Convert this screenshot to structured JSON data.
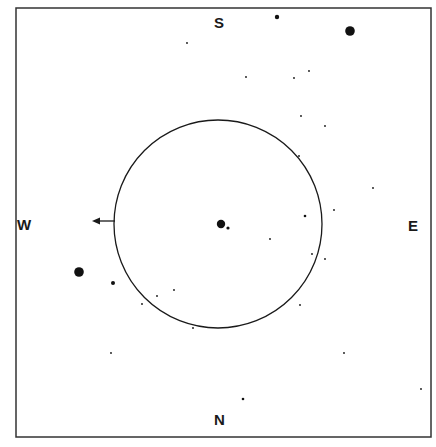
{
  "diagram": {
    "type": "star-finder-chart",
    "frame": {
      "x": 16,
      "y": 8,
      "width": 415,
      "height": 429,
      "stroke": "#333333"
    },
    "circle": {
      "cx": 218,
      "cy": 224,
      "r": 104,
      "stroke": "#1a1a1a"
    },
    "arrow": {
      "x1": 115,
      "y1": 221,
      "x2": 92,
      "y2": 221,
      "direction": "west"
    },
    "compass": {
      "north": {
        "label": "N",
        "x": 219,
        "y": 412
      },
      "south": {
        "label": "S",
        "x": 219,
        "y": 15
      },
      "east": {
        "label": "E",
        "x": 413,
        "y": 218
      },
      "west": {
        "label": "W",
        "x": 22,
        "y": 217
      }
    },
    "stars": [
      {
        "x": 277,
        "y": 17,
        "r": 2.2
      },
      {
        "x": 350,
        "y": 31,
        "r": 4.8
      },
      {
        "x": 187,
        "y": 43,
        "r": 0.9
      },
      {
        "x": 246,
        "y": 77,
        "r": 0.9
      },
      {
        "x": 294,
        "y": 78,
        "r": 0.9
      },
      {
        "x": 309,
        "y": 71,
        "r": 0.9
      },
      {
        "x": 301,
        "y": 116,
        "r": 0.9
      },
      {
        "x": 325,
        "y": 126,
        "r": 0.9
      },
      {
        "x": 299,
        "y": 156,
        "r": 0.9
      },
      {
        "x": 373,
        "y": 188,
        "r": 0.9
      },
      {
        "x": 334,
        "y": 210,
        "r": 0.9
      },
      {
        "x": 305,
        "y": 216,
        "r": 1.3
      },
      {
        "x": 221,
        "y": 224,
        "r": 4.2
      },
      {
        "x": 228,
        "y": 228,
        "r": 1.6
      },
      {
        "x": 270,
        "y": 239,
        "r": 0.9
      },
      {
        "x": 312,
        "y": 254,
        "r": 0.9
      },
      {
        "x": 325,
        "y": 259,
        "r": 0.9
      },
      {
        "x": 300,
        "y": 305,
        "r": 0.9
      },
      {
        "x": 79,
        "y": 272,
        "r": 4.8
      },
      {
        "x": 113,
        "y": 283,
        "r": 2.0
      },
      {
        "x": 174,
        "y": 290,
        "r": 0.9
      },
      {
        "x": 157,
        "y": 296,
        "r": 0.9
      },
      {
        "x": 142,
        "y": 304,
        "r": 0.9
      },
      {
        "x": 193,
        "y": 328,
        "r": 0.9
      },
      {
        "x": 111,
        "y": 353,
        "r": 0.9
      },
      {
        "x": 344,
        "y": 353,
        "r": 0.9
      },
      {
        "x": 421,
        "y": 389,
        "r": 0.9
      },
      {
        "x": 243,
        "y": 399,
        "r": 1.3
      }
    ]
  }
}
